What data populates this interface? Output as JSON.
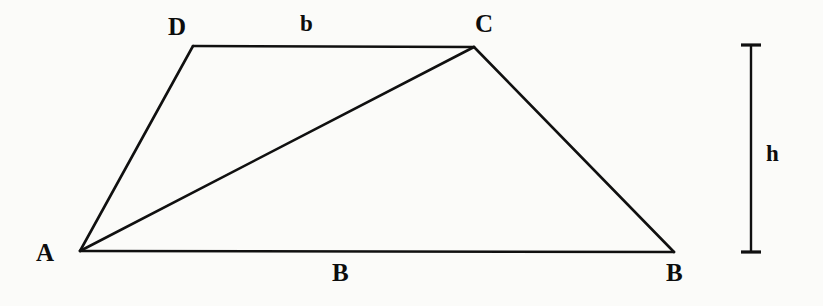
{
  "figure": {
    "background_color": "#fbfbf9",
    "stroke_color": "#101010",
    "labels": {
      "vertex_a": "A",
      "vertex_d": "D",
      "vertex_c": "C",
      "vertex_b_right": "B",
      "base_b_lower": "B",
      "top_side_b": "b",
      "height_h": "h"
    },
    "geometry": {
      "vertex_a": {
        "x": 80,
        "y": 251
      },
      "vertex_b": {
        "x": 674,
        "y": 252
      },
      "vertex_c": {
        "x": 474,
        "y": 47
      },
      "vertex_d": {
        "x": 193,
        "y": 46
      },
      "diagonal": {
        "from": "A",
        "to": "C"
      },
      "height_bar": {
        "x": 751,
        "y_top": 45,
        "y_bottom": 252,
        "cap_half_width": 10
      }
    }
  }
}
